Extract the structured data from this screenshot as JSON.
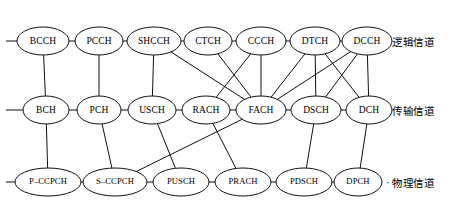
{
  "diagram": {
    "background_color": "#ffffff",
    "line_color": "#111111",
    "node_fill": "#ffffff",
    "width": 458,
    "height": 200,
    "ellipsis_label": "···"
  },
  "rows": [
    {
      "id": "logical",
      "label": "逻辑信道",
      "label_x": 392,
      "label_y": 34,
      "cy": 41,
      "stub": true
    },
    {
      "id": "transport",
      "label": "传输信道",
      "label_x": 392,
      "label_y": 103,
      "cy": 110,
      "stub": true
    },
    {
      "id": "physical",
      "label": "物理信道",
      "label_x": 392,
      "label_y": 175,
      "cy": 182,
      "stub": true
    }
  ],
  "nodes": [
    {
      "id": "BCCH",
      "label": "BCCH",
      "row": "logical",
      "cx": 43,
      "cy": 41,
      "rx": 26,
      "ry": 14,
      "small": false
    },
    {
      "id": "PCCH",
      "label": "PCCH",
      "row": "logical",
      "cx": 99,
      "cy": 41,
      "rx": 24,
      "ry": 14,
      "small": false
    },
    {
      "id": "SHCCH",
      "label": "SHCCH",
      "row": "logical",
      "cx": 154,
      "cy": 41,
      "rx": 27,
      "ry": 14,
      "small": false
    },
    {
      "id": "CTCH",
      "label": "CTCH",
      "row": "logical",
      "cx": 208,
      "cy": 41,
      "rx": 24,
      "ry": 14,
      "small": false
    },
    {
      "id": "CCCH",
      "label": "CCCH",
      "row": "logical",
      "cx": 261,
      "cy": 41,
      "rx": 25,
      "ry": 14,
      "small": false
    },
    {
      "id": "DTCH",
      "label": "DTCH",
      "row": "logical",
      "cx": 315,
      "cy": 41,
      "rx": 25,
      "ry": 14,
      "small": false
    },
    {
      "id": "DCCH",
      "label": "DCCH",
      "row": "logical",
      "cx": 367,
      "cy": 41,
      "rx": 25,
      "ry": 14,
      "small": false
    },
    {
      "id": "BCH",
      "label": "BCH",
      "row": "transport",
      "cx": 46,
      "cy": 110,
      "rx": 23,
      "ry": 14,
      "small": false
    },
    {
      "id": "PCH",
      "label": "PCH",
      "row": "transport",
      "cx": 99,
      "cy": 110,
      "rx": 22,
      "ry": 14,
      "small": false
    },
    {
      "id": "USCH",
      "label": "USCH",
      "row": "transport",
      "cx": 152,
      "cy": 110,
      "rx": 24,
      "ry": 14,
      "small": false
    },
    {
      "id": "RACH",
      "label": "RACH",
      "row": "transport",
      "cx": 206,
      "cy": 110,
      "rx": 24,
      "ry": 14,
      "small": false
    },
    {
      "id": "FACH",
      "label": "FACH",
      "row": "transport",
      "cx": 261,
      "cy": 110,
      "rx": 25,
      "ry": 14,
      "small": false
    },
    {
      "id": "DSCH",
      "label": "DSCH",
      "row": "transport",
      "cx": 316,
      "cy": 110,
      "rx": 25,
      "ry": 14,
      "small": false
    },
    {
      "id": "DCH",
      "label": "DCH",
      "row": "transport",
      "cx": 369,
      "cy": 110,
      "rx": 23,
      "ry": 14,
      "small": false
    },
    {
      "id": "P-CCPCH",
      "label": "P–CCPCH",
      "row": "physical",
      "cx": 48,
      "cy": 182,
      "rx": 33,
      "ry": 14,
      "small": true
    },
    {
      "id": "S-CCPCH",
      "label": "S–CCPCH",
      "row": "physical",
      "cx": 115,
      "cy": 182,
      "rx": 32,
      "ry": 14,
      "small": true
    },
    {
      "id": "PUSCH",
      "label": "PUSCH",
      "row": "physical",
      "cx": 181,
      "cy": 182,
      "rx": 28,
      "ry": 14,
      "small": true
    },
    {
      "id": "PRACH",
      "label": "PRACH",
      "row": "physical",
      "cx": 243,
      "cy": 182,
      "rx": 28,
      "ry": 14,
      "small": true
    },
    {
      "id": "PDSCH",
      "label": "PDSCH",
      "row": "physical",
      "cx": 304,
      "cy": 182,
      "rx": 28,
      "ry": 14,
      "small": true
    },
    {
      "id": "DPCH",
      "label": "DPCH",
      "row": "physical",
      "cx": 358,
      "cy": 182,
      "rx": 24,
      "ry": 14,
      "small": true
    }
  ],
  "ellipsis": {
    "x": 386,
    "y": 176
  },
  "stubs": [
    {
      "x1": 6,
      "y1": 41,
      "x2": 17,
      "y2": 41
    },
    {
      "x1": 6,
      "y1": 110,
      "x2": 23,
      "y2": 110
    },
    {
      "x1": 6,
      "y1": 182,
      "x2": 15,
      "y2": 182
    }
  ],
  "edges": [
    {
      "from": "BCCH",
      "to": "PCCH",
      "kind": "horizontal"
    },
    {
      "from": "PCCH",
      "to": "SHCCH",
      "kind": "horizontal"
    },
    {
      "from": "SHCCH",
      "to": "CTCH",
      "kind": "horizontal"
    },
    {
      "from": "CTCH",
      "to": "CCCH",
      "kind": "horizontal"
    },
    {
      "from": "CCCH",
      "to": "DTCH",
      "kind": "horizontal"
    },
    {
      "from": "DTCH",
      "to": "DCCH",
      "kind": "horizontal"
    },
    {
      "from": "BCH",
      "to": "PCH",
      "kind": "horizontal"
    },
    {
      "from": "PCH",
      "to": "USCH",
      "kind": "horizontal"
    },
    {
      "from": "USCH",
      "to": "RACH",
      "kind": "horizontal"
    },
    {
      "from": "RACH",
      "to": "FACH",
      "kind": "horizontal"
    },
    {
      "from": "FACH",
      "to": "DSCH",
      "kind": "horizontal"
    },
    {
      "from": "DSCH",
      "to": "DCH",
      "kind": "horizontal"
    },
    {
      "from": "P-CCPCH",
      "to": "S-CCPCH",
      "kind": "horizontal"
    },
    {
      "from": "S-CCPCH",
      "to": "PUSCH",
      "kind": "horizontal"
    },
    {
      "from": "PUSCH",
      "to": "PRACH",
      "kind": "horizontal"
    },
    {
      "from": "PRACH",
      "to": "PDSCH",
      "kind": "horizontal"
    },
    {
      "from": "PDSCH",
      "to": "DPCH",
      "kind": "horizontal"
    },
    {
      "from": "BCCH",
      "to": "BCH",
      "kind": "mapping"
    },
    {
      "from": "PCCH",
      "to": "PCH",
      "kind": "mapping"
    },
    {
      "from": "SHCCH",
      "to": "USCH",
      "kind": "mapping"
    },
    {
      "from": "SHCCH",
      "to": "FACH",
      "kind": "mapping"
    },
    {
      "from": "CTCH",
      "to": "FACH",
      "kind": "mapping"
    },
    {
      "from": "CCCH",
      "to": "RACH",
      "kind": "mapping"
    },
    {
      "from": "CCCH",
      "to": "FACH",
      "kind": "mapping"
    },
    {
      "from": "DTCH",
      "to": "FACH",
      "kind": "mapping"
    },
    {
      "from": "DTCH",
      "to": "DSCH",
      "kind": "mapping"
    },
    {
      "from": "DTCH",
      "to": "DCH",
      "kind": "mapping"
    },
    {
      "from": "DCCH",
      "to": "FACH",
      "kind": "mapping"
    },
    {
      "from": "DCCH",
      "to": "DSCH",
      "kind": "mapping"
    },
    {
      "from": "DCCH",
      "to": "DCH",
      "kind": "mapping"
    },
    {
      "from": "BCH",
      "to": "P-CCPCH",
      "kind": "mapping"
    },
    {
      "from": "PCH",
      "to": "S-CCPCH",
      "kind": "mapping"
    },
    {
      "from": "FACH",
      "to": "S-CCPCH",
      "kind": "mapping"
    },
    {
      "from": "USCH",
      "to": "PUSCH",
      "kind": "mapping"
    },
    {
      "from": "RACH",
      "to": "PRACH",
      "kind": "mapping"
    },
    {
      "from": "DSCH",
      "to": "PDSCH",
      "kind": "mapping"
    },
    {
      "from": "DCH",
      "to": "DPCH",
      "kind": "mapping"
    }
  ]
}
